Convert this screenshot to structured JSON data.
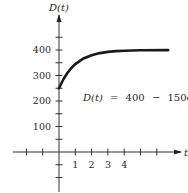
{
  "chart_data": {
    "type": "line",
    "title": "",
    "xlabel": "t",
    "ylabel": "D(t)",
    "equation": "D(t) = 400 − 150e^(−t)",
    "equation_parts": {
      "lhs": "D(t)",
      "eq": "=",
      "a": "400",
      "minus": "−",
      "b": "150e",
      "exp": "−t"
    },
    "x_ticks": [
      -2,
      -1,
      1,
      2,
      3,
      4,
      5,
      6
    ],
    "x_tick_labels": [
      "1",
      "2",
      "3",
      "4"
    ],
    "x_tick_label_values": [
      1,
      2,
      3,
      4
    ],
    "y_ticks": [
      -100,
      -50,
      50,
      100,
      150,
      200,
      250,
      300,
      350,
      400,
      450
    ],
    "y_tick_labels": [
      "100",
      "200",
      "300",
      "400"
    ],
    "y_tick_label_values": [
      100,
      200,
      300,
      400
    ],
    "xlim": [
      -2.9,
      7.6
    ],
    "ylim": [
      -160,
      540
    ],
    "series": [
      {
        "name": "D(t)",
        "x": [
          0,
          0.25,
          0.5,
          0.75,
          1,
          1.5,
          2,
          2.5,
          3,
          3.5,
          4,
          5,
          6.7
        ],
        "values": [
          250,
          283.2,
          309.0,
          329.1,
          344.8,
          366.5,
          379.7,
          387.7,
          392.5,
          395.5,
          397.3,
          399.0,
          399.8
        ]
      }
    ],
    "asymptote": 400,
    "initial_value": 250,
    "grid": false,
    "legend": "none"
  }
}
